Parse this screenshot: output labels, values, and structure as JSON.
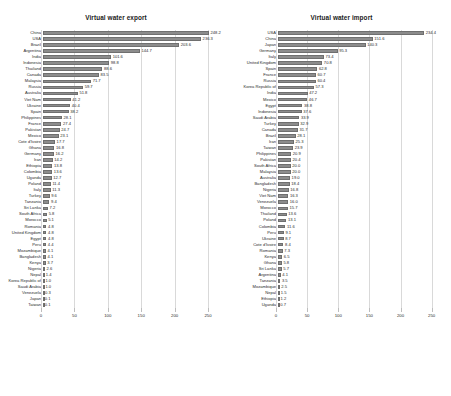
{
  "charts": [
    {
      "title": "Virtual water export",
      "label_width_px": 41,
      "axis": {
        "min": 0,
        "max": 265,
        "ticks": [
          0,
          50,
          100,
          150,
          200,
          250
        ]
      },
      "chart_data": {
        "type": "bar",
        "orientation": "horizontal",
        "title": "Virtual water export",
        "xlabel": "",
        "ylabel": "",
        "xlim": [
          0,
          265
        ],
        "grid": true,
        "legend": "none",
        "categories": [
          "China",
          "USA",
          "Brazil",
          "Argentina",
          "India",
          "Indonesia",
          "Thailand",
          "Canada",
          "Malaysia",
          "Russia",
          "Australia",
          "Viet Nam",
          "Ukraine",
          "Spain",
          "Philippines",
          "France",
          "Pakistan",
          "Mexico",
          "Cote d'Ivoire",
          "Ghana",
          "Germany",
          "Iran",
          "Ethiopia",
          "Colombia",
          "Uganda",
          "Poland",
          "Italy",
          "Turkey",
          "Tanzania",
          "Sri Lanka",
          "South Africa",
          "Morocco",
          "Romania",
          "United Kingdom",
          "Egypt",
          "Peru",
          "Mozambique",
          "Bangladesh",
          "Kenya",
          "Nigeria",
          "Nepal",
          "Korea Republic of",
          "Saudi Arabia",
          "Venezuela",
          "Japan",
          "Taiwan"
        ],
        "values": [
          248.2,
          236.3,
          203.6,
          144.7,
          101.6,
          98.8,
          88.6,
          83.5,
          71.7,
          59.7,
          51.8,
          41.2,
          40.4,
          38.2,
          28.1,
          27.4,
          24.7,
          23.1,
          17.7,
          16.8,
          16.2,
          14.2,
          13.8,
          13.6,
          12.7,
          11.4,
          11.3,
          9.6,
          9.4,
          7.2,
          5.8,
          5.1,
          4.8,
          4.8,
          4.8,
          4.4,
          4.1,
          4.1,
          3.7,
          2.6,
          1.4,
          1.0,
          1.0,
          0.3,
          0.1,
          0.1
        ]
      }
    },
    {
      "title": "Virtual water import",
      "label_width_px": 44,
      "axis": {
        "min": 0,
        "max": 265,
        "ticks": [
          0,
          50,
          100,
          150,
          200,
          250
        ]
      },
      "chart_data": {
        "type": "bar",
        "orientation": "horizontal",
        "title": "Virtual water import",
        "xlabel": "",
        "ylabel": "",
        "xlim": [
          0,
          265
        ],
        "grid": true,
        "legend": "none",
        "categories": [
          "USA",
          "China",
          "Japan",
          "Germany",
          "Italy",
          "United Kingdom",
          "Spain",
          "France",
          "Russia",
          "Korea Republic of",
          "India",
          "Mexico",
          "Egypt",
          "Indonesia",
          "Saudi Arabia",
          "Turkey",
          "Canada",
          "Brazil",
          "Iran",
          "Taiwan",
          "Philippines",
          "Pakistan",
          "South Africa",
          "Malaysia",
          "Australia",
          "Bangladesh",
          "Nigeria",
          "Viet Nam",
          "Venezuela",
          "Morocco",
          "Thailand",
          "Poland",
          "Colombia",
          "Peru",
          "Ukraine",
          "Cote d'Ivoire",
          "Romania",
          "Kenya",
          "Ghana",
          "Sri Lanka",
          "Argentina",
          "Tanzania",
          "Mozambique",
          "Nepal",
          "Ethiopia",
          "Uganda"
        ],
        "values": [
          234.4,
          151.6,
          140.3,
          95.3,
          73.4,
          70.8,
          62.8,
          60.7,
          60.4,
          57.3,
          47.2,
          46.7,
          38.8,
          37.6,
          33.9,
          32.9,
          31.7,
          28.1,
          25.3,
          23.9,
          20.9,
          20.4,
          20.0,
          20.0,
          19.0,
          18.4,
          16.8,
          16.3,
          16.0,
          15.7,
          13.6,
          13.1,
          11.6,
          9.1,
          8.7,
          8.4,
          7.3,
          6.5,
          5.8,
          5.7,
          4.1,
          3.5,
          2.5,
          1.5,
          1.2,
          0.7
        ]
      }
    }
  ]
}
